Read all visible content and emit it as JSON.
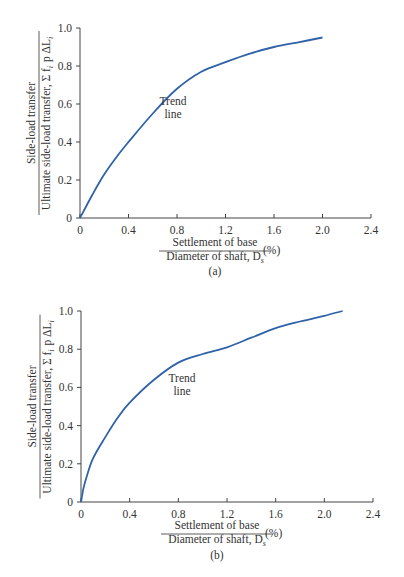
{
  "colors": {
    "curve": "#2f62a8",
    "axis": "#444444",
    "text": "#333333",
    "background": "#ffffff"
  },
  "chart_data": [
    {
      "type": "line",
      "caption": "(a)",
      "ylabel_numerator": "Side-load transfer",
      "ylabel_denominator": "Ultimate side-load transfer, Σ f_i p ΔL_i",
      "xlabel_numerator": "Settlement of base",
      "xlabel_denominator": "Diameter of shaft, D_s",
      "xlabel_unit": "(%)",
      "annotation": "Trend line",
      "xlim": [
        0,
        2.4
      ],
      "ylim": [
        0,
        1.0
      ],
      "x_ticks": [
        "0",
        "0.4",
        "0.8",
        "1.2",
        "1.6",
        "2.0",
        "2.4"
      ],
      "y_ticks": [
        "0",
        "0.2",
        "0.4",
        "0.6",
        "0.8",
        "1.0"
      ],
      "grid": false,
      "series": [
        {
          "name": "Trend line",
          "x": [
            0,
            0.1,
            0.2,
            0.3,
            0.4,
            0.6,
            0.8,
            1.0,
            1.2,
            1.4,
            1.6,
            1.8,
            2.0
          ],
          "y": [
            0,
            0.12,
            0.23,
            0.32,
            0.4,
            0.55,
            0.68,
            0.77,
            0.82,
            0.865,
            0.9,
            0.925,
            0.95
          ]
        }
      ]
    },
    {
      "type": "line",
      "caption": "(b)",
      "ylabel_numerator": "Side-load transfer",
      "ylabel_denominator": "Ultimate side-load transfer, Σ f_i p ΔL_i",
      "xlabel_numerator": "Settlement of base",
      "xlabel_denominator": "Diameter of shaft, D_s",
      "xlabel_unit": "(%)",
      "annotation": "Trend line",
      "xlim": [
        0,
        2.4
      ],
      "ylim": [
        0,
        1.0
      ],
      "x_ticks": [
        "0",
        "0.4",
        "0.8",
        "1.2",
        "1.6",
        "2.0",
        "2.4"
      ],
      "y_ticks": [
        "0",
        "0.2",
        "0.4",
        "0.6",
        "0.8",
        "1.0"
      ],
      "grid": false,
      "series": [
        {
          "name": "Trend line",
          "x": [
            0,
            0.02,
            0.05,
            0.1,
            0.2,
            0.3,
            0.4,
            0.6,
            0.8,
            1.0,
            1.2,
            1.4,
            1.6,
            1.8,
            2.0,
            2.15
          ],
          "y": [
            0,
            0.07,
            0.14,
            0.23,
            0.34,
            0.44,
            0.52,
            0.64,
            0.73,
            0.775,
            0.81,
            0.86,
            0.91,
            0.945,
            0.975,
            1.0
          ]
        }
      ]
    }
  ]
}
